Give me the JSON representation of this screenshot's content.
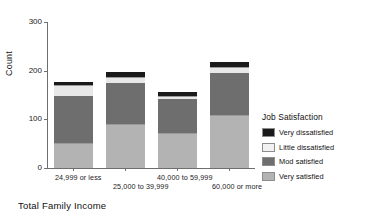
{
  "chart_data": {
    "type": "bar",
    "title": "",
    "subtitle": "",
    "stacked": true,
    "orientation": "vertical",
    "xlabel": "Total Family Income",
    "ylabel": "Count",
    "ylim": [
      0,
      300
    ],
    "yticks": [
      0,
      100,
      200,
      300
    ],
    "ytick_labels": [
      "0",
      "100",
      "200",
      "300"
    ],
    "grid": false,
    "legend_position": "right",
    "legend_title": "Job Satisfaction",
    "categories": [
      "24,999 or less",
      "25,000 to 39,999",
      "40,000 to 59,999",
      "60,000 or more"
    ],
    "series": [
      {
        "name": "Very satisfied",
        "color": "#b3b3b3",
        "values": [
          51,
          90,
          72,
          109
        ]
      },
      {
        "name": "Mod satisfied",
        "color": "#6e6e6e",
        "values": [
          97,
          84,
          70,
          86
        ]
      },
      {
        "name": "Little dissatisfied",
        "color": "#e8e8e8",
        "values": [
          22,
          14,
          6,
          12
        ]
      },
      {
        "name": "Very dissatisfied",
        "color": "#1a1a1a",
        "values": [
          6,
          10,
          8,
          10
        ]
      }
    ],
    "stack_order_bottom_to_top": [
      "Very satisfied",
      "Mod satisfied",
      "Little dissatisfied",
      "Very dissatisfied"
    ],
    "totals": [
      176,
      198,
      156,
      217
    ],
    "legend_entries_top_to_bottom": [
      {
        "label": "Very dissatisfied",
        "color": "#1a1a1a"
      },
      {
        "label": "Little dissatisfied",
        "color": "#f2f2f2"
      },
      {
        "label": "Mod satisfied",
        "color": "#6e6e6e"
      },
      {
        "label": "Very satisfied",
        "color": "#b3b3b3"
      }
    ]
  },
  "axes": {
    "y_title": "Count",
    "x_title": "Total Family Income"
  },
  "colors": {
    "axis": "#6e6e6e",
    "text": "#111111",
    "background": "#ffffff"
  }
}
